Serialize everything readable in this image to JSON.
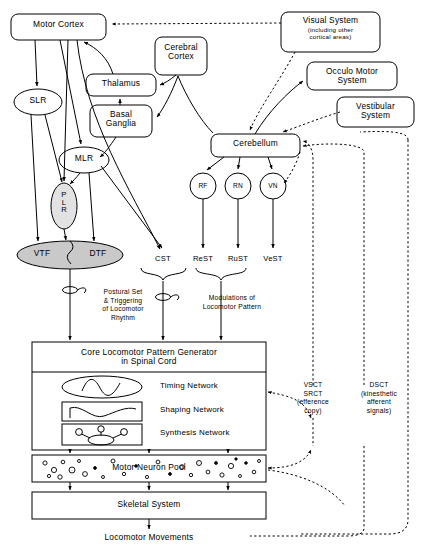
{
  "diagram": {
    "type": "block-flow-diagram",
    "colors": {
      "stroke": "#000000",
      "background": "#ffffff",
      "shaded_fill": "#c9c9c9",
      "light_fill": "#e2e2e2"
    }
  },
  "nodes": {
    "motor_cortex": "Motor Cortex",
    "cerebral_cortex": "Cerebral\nCortex",
    "thalamus": "Thalamus",
    "basal_ganglia": "Basal\nGanglia",
    "visual_system": "Visual System",
    "visual_system_sub": "(including other\ncortical areas)",
    "occulo_motor_system": "Occulo Motor\nSystem",
    "vestibular_system": "Vestibular\nSystem",
    "cerebellum": "Cerebellum",
    "slr": "SLR",
    "mlr": "MLR",
    "plr": "PLR",
    "vtf": "VTF",
    "dtf": "DTF",
    "rf": "RF",
    "rn": "RN",
    "vn": "VN"
  },
  "tracts": {
    "cst": "CST",
    "rest": "ReST",
    "rust": "RuST",
    "vest": "VeST"
  },
  "annotations": {
    "postural_set": "Postural Set\n& Triggering\nof Locomotor\nRhythm",
    "modulations": "Modulations of\nLocomotor Pattern",
    "vsct_srct": "VSCT\nSRCT\n(efference\ncopy)",
    "dsct": "DSCT\n(kinesthetic\nafferent\nsignals)"
  },
  "spinal": {
    "cpg_title": "Core Locomotor Pattern Generator\nin Spinal Cord",
    "timing_network": "Timing Network",
    "shaping_network": "Shaping Network",
    "synthesis_network": "Synthesis Network",
    "motor_neuron_pool": "Motor Neuron Pool",
    "skeletal_system": "Skeletal System",
    "output": "Locomotor Movements"
  }
}
